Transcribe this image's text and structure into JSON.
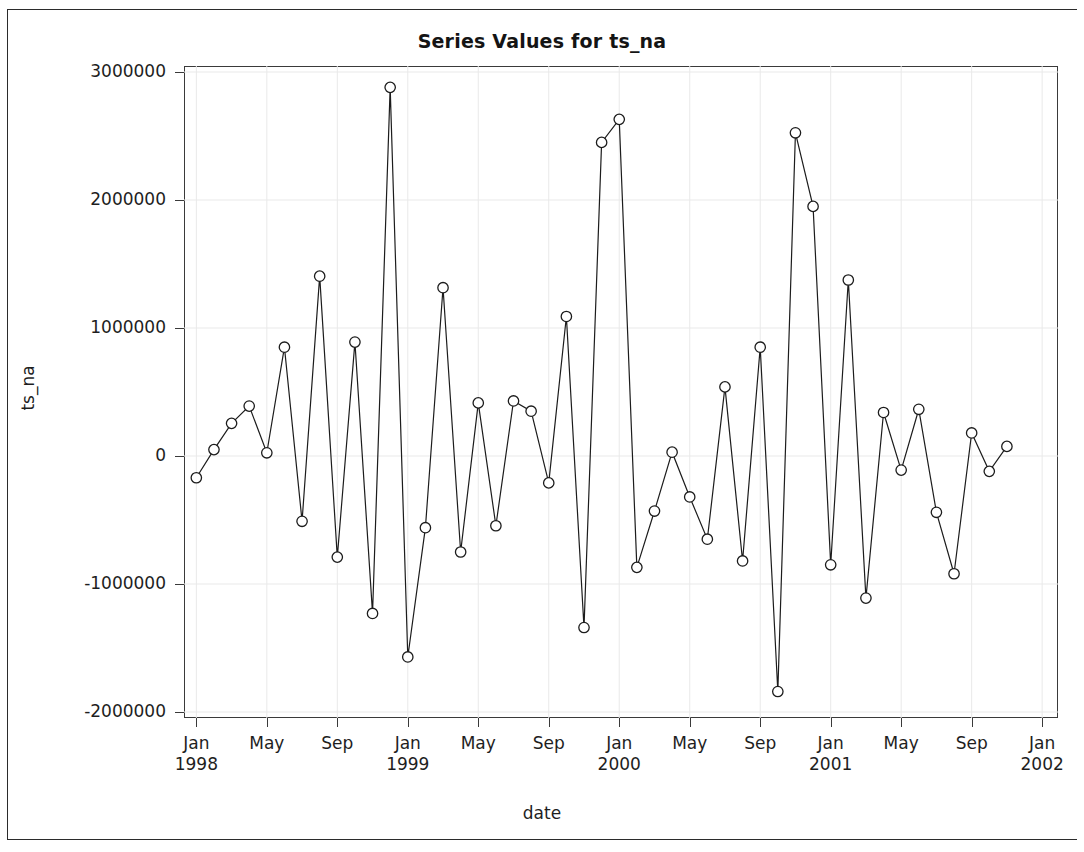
{
  "chart_data": {
    "type": "line",
    "title": "Series Values for ts_na",
    "xlabel": "date",
    "ylabel": "ts_na",
    "grid": true,
    "legend": null,
    "marker": "open-circle",
    "ylim": [
      -2100000,
      3100000
    ],
    "ytick_labels": [
      "3000000",
      "2000000",
      "1000000",
      "0",
      "-1000000",
      "-2000000"
    ],
    "ytick_values": [
      3000000,
      2000000,
      1000000,
      0,
      -1000000,
      -2000000
    ],
    "xtick_labels": [
      {
        "month": "Jan",
        "year": "1998"
      },
      {
        "month": "May",
        "year": ""
      },
      {
        "month": "Sep",
        "year": ""
      },
      {
        "month": "Jan",
        "year": "1999"
      },
      {
        "month": "May",
        "year": ""
      },
      {
        "month": "Sep",
        "year": ""
      },
      {
        "month": "Jan",
        "year": "2000"
      },
      {
        "month": "May",
        "year": ""
      },
      {
        "month": "Sep",
        "year": ""
      },
      {
        "month": "Jan",
        "year": "2001"
      },
      {
        "month": "May",
        "year": ""
      },
      {
        "month": "Sep",
        "year": ""
      },
      {
        "month": "Jan",
        "year": "2002"
      }
    ],
    "xtick_values": [
      0,
      4,
      8,
      12,
      16,
      20,
      24,
      28,
      32,
      36,
      40,
      44,
      48
    ],
    "xlim": [
      -0.7,
      48.9
    ],
    "x": [
      0,
      1,
      2,
      3,
      4,
      5,
      6,
      7,
      8,
      9,
      10,
      11,
      12,
      13,
      14,
      15,
      16,
      17,
      18,
      19,
      20,
      21,
      22,
      23,
      24,
      25,
      26,
      27,
      28,
      29,
      30,
      31,
      32,
      33,
      34,
      35,
      36,
      37,
      38,
      39,
      40,
      41,
      42,
      43,
      44,
      45,
      46,
      47,
      48
    ],
    "x_dates": [
      "Jan 1998",
      "Feb 1998",
      "Mar 1998",
      "Apr 1998",
      "May 1998",
      "Jun 1998",
      "Jul 1998",
      "Aug 1998",
      "Sep 1998",
      "Oct 1998",
      "Nov 1998",
      "Dec 1998",
      "Jan 1999",
      "Feb 1999",
      "Mar 1999",
      "Apr 1999",
      "May 1999",
      "Jun 1999",
      "Jul 1999",
      "Aug 1999",
      "Sep 1999",
      "Oct 1999",
      "Nov 1999",
      "Dec 1999",
      "Jan 2000",
      "Feb 2000",
      "Mar 2000",
      "Apr 2000",
      "May 2000",
      "Jun 2000",
      "Jul 2000",
      "Aug 2000",
      "Sep 2000",
      "Oct 2000",
      "Nov 2000",
      "Dec 2000",
      "Jan 2001",
      "Feb 2001",
      "Mar 2001",
      "Apr 2001",
      "May 2001",
      "Jun 2001",
      "Jul 2001",
      "Aug 2001",
      "Sep 2001",
      "Oct 2001",
      "Nov 2001",
      "Dec 2001",
      "Jan 2002"
    ],
    "values": [
      -170000,
      50000,
      255000,
      390000,
      25000,
      850000,
      -510000,
      1405000,
      -790000,
      890000,
      -1230000,
      2880000,
      -1570000,
      -560000,
      1315000,
      -750000,
      415000,
      -545000,
      430000,
      350000,
      -210000,
      1090000,
      -1340000,
      2450000,
      2630000,
      -870000,
      -430000,
      30000,
      -320000,
      -650000,
      540000,
      -820000,
      850000,
      -1840000,
      2525000,
      1950000,
      -850000,
      1375000,
      -1110000,
      340000,
      -110000,
      365000,
      -440000,
      -920000,
      180000,
      -120000,
      75000,
      null,
      null
    ],
    "series_name": "ts_na",
    "n_points": 47
  }
}
